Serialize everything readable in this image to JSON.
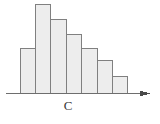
{
  "figure": {
    "kind": "histogram-sketch",
    "background_color": "#ffffff",
    "axis": {
      "label": "C",
      "label_x": 68,
      "label_y": 99,
      "line_color": "#6e6e6e",
      "baseline_y": 93,
      "x_start": 6,
      "x_end": 150,
      "arrow": true,
      "arrow_tip_x": 150,
      "arrow_color": "#4a4a4a"
    },
    "bars": {
      "fill_color": "#ededed",
      "stroke_color": "#808080",
      "stroke_width": 1,
      "left_x": 20,
      "bar_width": 15.4
    }
  },
  "chart_data": {
    "type": "bar",
    "title": "",
    "subtitle": "",
    "xlabel": "C",
    "ylabel": "",
    "grid": false,
    "legend": null,
    "axis_range_x": [
      20,
      128
    ],
    "ylim": [
      0,
      89
    ],
    "categories": [
      "1",
      "2",
      "3",
      "4",
      "5",
      "6",
      "7"
    ],
    "values": [
      45,
      89,
      74,
      59,
      45,
      33,
      17
    ],
    "bar_tops_y": [
      48,
      4,
      19,
      34,
      48,
      60,
      76
    ],
    "baseline_y": 93,
    "annotations": []
  }
}
